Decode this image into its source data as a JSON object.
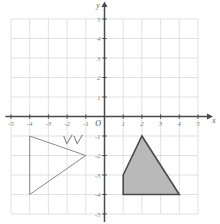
{
  "chart_data": {
    "type": "scatter",
    "title": "",
    "xlabel": "x",
    "ylabel": "y",
    "xlim": [
      -5,
      5
    ],
    "ylim": [
      -5,
      5
    ],
    "grid": true,
    "legend": "none",
    "x_ticks": [
      "-5",
      "-4",
      "-3",
      "-2",
      "-1",
      "1",
      "2",
      "3",
      "4",
      "5"
    ],
    "y_ticks": [
      "5",
      "4",
      "3",
      "2",
      "1",
      "-1",
      "-2",
      "-3",
      "-4",
      "-5"
    ],
    "origin_label": "O",
    "x_axis_name": "x",
    "y_axis_name": "y",
    "shapes": [
      {
        "name": "left-triangle-outline",
        "kind": "polygon",
        "filled": false,
        "stroke": "#8a8a8a",
        "fill": "none",
        "points": [
          [
            -4,
            -1
          ],
          [
            -1,
            -2
          ],
          [
            -4,
            -4
          ]
        ],
        "points_label": "(-4,-1), (-1,-2), (-4,-4)"
      },
      {
        "name": "right-quadrilateral-shaded",
        "kind": "polygon",
        "filled": true,
        "stroke": "#4a4a4a",
        "fill": "#b9b9b9",
        "points": [
          [
            1,
            -3
          ],
          [
            2,
            -1
          ],
          [
            4,
            -4
          ],
          [
            1,
            -4
          ]
        ],
        "points_label": "(1,-3), (2,-1), (4,-4), (1,-4)"
      }
    ],
    "annotations": [
      {
        "name": "check-mark-1",
        "kind": "check",
        "x": -1.95,
        "y": -1.22,
        "stroke": "#8a8a8a"
      },
      {
        "name": "check-mark-2",
        "kind": "check",
        "x": -1.4,
        "y": -1.22,
        "stroke": "#8a8a8a"
      }
    ],
    "colors": {
      "grid": "#d9d9d9",
      "axis": "#4a4a4a",
      "tick_text": "#7c7c7c",
      "shape_fill": "#b9b9b9",
      "shape_stroke_dark": "#4a4a4a",
      "shape_stroke_light": "#8a8a8a",
      "background": "#ffffff"
    }
  }
}
